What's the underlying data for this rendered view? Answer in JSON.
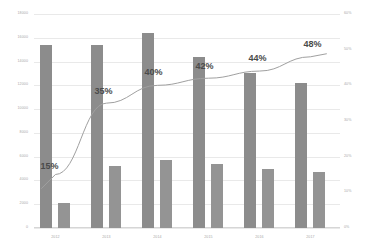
{
  "chart_data": {
    "type": "bar",
    "title": "",
    "subtitle": "",
    "xlabel": "",
    "ylabel": "",
    "y2label": "",
    "categories": [
      "2012",
      "2013",
      "2014",
      "2015",
      "2016",
      "2017"
    ],
    "ylim": [
      0,
      18000
    ],
    "y2lim": [
      0,
      60
    ],
    "grid": true,
    "legend_position": "none",
    "y_ticks": [
      "18000",
      "16000",
      "14000",
      "12000",
      "10000",
      "8000",
      "6000",
      "4000",
      "2000",
      "0"
    ],
    "y_tick_values": [
      18000,
      16000,
      14000,
      12000,
      10000,
      8000,
      6000,
      4000,
      2000,
      0
    ],
    "y2_ticks": [
      "60%",
      "50%",
      "40%",
      "30%",
      "20%",
      "10%",
      "0%"
    ],
    "y2_tick_values": [
      60,
      50,
      40,
      30,
      20,
      10,
      0
    ],
    "series": [
      {
        "name": "Series 1",
        "type": "bar",
        "axis": "left",
        "color": "#8c8c8c",
        "values": [
          15400,
          15400,
          16400,
          14400,
          13000,
          12200
        ]
      },
      {
        "name": "Series 2",
        "type": "bar",
        "axis": "left",
        "color": "#949494",
        "values": [
          2100,
          5200,
          5700,
          5400,
          5000,
          4700
        ]
      },
      {
        "name": "Rate",
        "type": "line",
        "axis": "right",
        "color": "#a0a0a0",
        "values": [
          15,
          35,
          40,
          42,
          44,
          48
        ],
        "labels": [
          "15%",
          "35%",
          "40%",
          "42%",
          "44%",
          "48%"
        ]
      }
    ],
    "annotations": [
      {
        "text": "15%",
        "x": 0,
        "y": 15
      },
      {
        "text": "35%",
        "x": 1,
        "y": 35
      },
      {
        "text": "40%",
        "x": 2,
        "y": 40
      },
      {
        "text": "42%",
        "x": 3,
        "y": 42
      },
      {
        "text": "44%",
        "x": 4,
        "y": 44
      },
      {
        "text": "48%",
        "x": 5,
        "y": 48
      }
    ]
  }
}
